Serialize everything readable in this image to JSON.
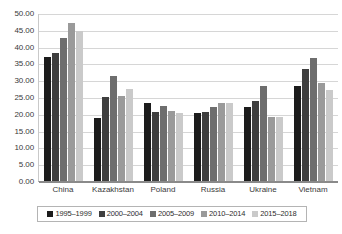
{
  "chart_data": {
    "type": "bar",
    "title": "",
    "subtitle": "",
    "xlabel": "",
    "ylabel": "",
    "ylim": [
      0,
      50
    ],
    "ytick_step": 5,
    "grid": true,
    "legend_position": "bottom",
    "categories": [
      "China",
      "Kazakhstan",
      "Poland",
      "Russia",
      "Ukraine",
      "Vietnam"
    ],
    "ytick_labels": [
      "0.00",
      "5.00",
      "10.00",
      "15.00",
      "20.00",
      "25.00",
      "30.00",
      "35.00",
      "40.00",
      "45.00",
      "50.00"
    ],
    "series": [
      {
        "name": "1995–1999",
        "color": "#1c1c1c",
        "values": [
          36.9,
          18.8,
          23.1,
          20.2,
          22.1,
          28.4
        ]
      },
      {
        "name": "2000–2004",
        "color": "#3f3f3f",
        "values": [
          38.1,
          24.9,
          20.5,
          20.6,
          23.9,
          33.2
        ]
      },
      {
        "name": "2005–2009",
        "color": "#6e6e6e",
        "values": [
          42.7,
          31.4,
          22.4,
          22.1,
          28.3,
          36.5
        ]
      },
      {
        "name": "2010–2014",
        "color": "#9a9a9a",
        "values": [
          47.0,
          25.3,
          20.7,
          23.3,
          19.0,
          29.2
        ]
      },
      {
        "name": "2015–2018",
        "color": "#cacaca",
        "values": [
          44.6,
          27.3,
          20.1,
          23.2,
          19.1,
          27.0
        ]
      }
    ]
  }
}
